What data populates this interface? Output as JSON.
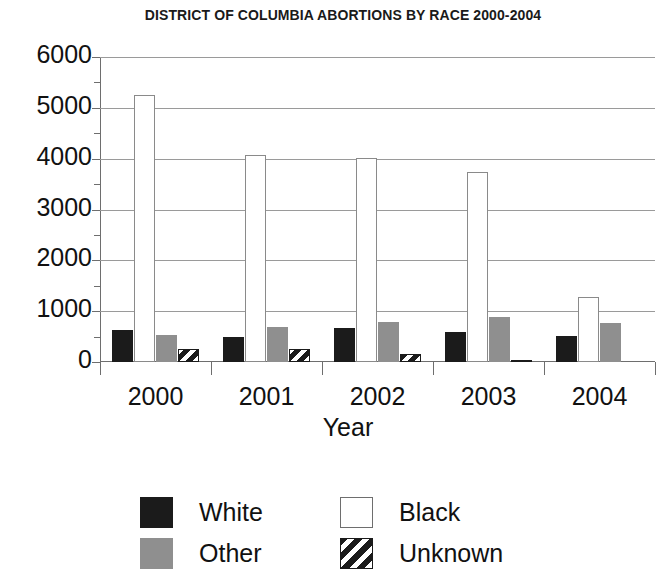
{
  "chart_data": {
    "type": "bar",
    "title": "DISTRICT OF COLUMBIA ABORTIONS BY RACE 2000-2004",
    "xlabel": "Year",
    "ylabel": "",
    "categories": [
      "2000",
      "2001",
      "2002",
      "2003",
      "2004"
    ],
    "series": [
      {
        "name": "White",
        "values": [
          620,
          490,
          660,
          600,
          520
        ]
      },
      {
        "name": "Black",
        "values": [
          5250,
          4080,
          4020,
          3740,
          1280
        ]
      },
      {
        "name": "Other",
        "values": [
          540,
          690,
          790,
          880,
          760
        ]
      },
      {
        "name": "Unknown",
        "values": [
          250,
          250,
          150,
          40,
          0
        ]
      }
    ],
    "ylim": [
      0,
      6000
    ],
    "yticks": [
      "0",
      "1000",
      "2000",
      "3000",
      "4000",
      "5000",
      "6000"
    ],
    "yminor_interval": 500,
    "grid": true,
    "legend_position": "bottom",
    "colors": {
      "White": "#1b1b1b",
      "Black": "#ffffff",
      "Other": "#8f8f8f",
      "Unknown": "#1b1b1b",
      "gridline": "#9a9a9a",
      "axis": "#6e6e6e",
      "text": "#111111",
      "background": "#ffffff"
    }
  },
  "legend": {
    "entries": [
      {
        "label": "White",
        "swatch": "solid-black-swatch"
      },
      {
        "label": "Black",
        "swatch": "outlined-white-swatch"
      },
      {
        "label": "Other",
        "swatch": "solid-gray-swatch"
      },
      {
        "label": "Unknown",
        "swatch": "diagonal-hatch-swatch"
      }
    ]
  }
}
